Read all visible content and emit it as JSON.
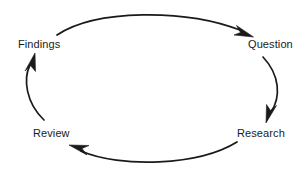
{
  "diagram": {
    "type": "cycle",
    "title": "",
    "stroke_color": "#1a1a1a",
    "background_color": "#ffffff",
    "text_color": "#1a1a1a",
    "nodes": [
      {
        "id": "findings",
        "label": "Findings",
        "position": "top-left"
      },
      {
        "id": "question",
        "label": "Question",
        "position": "top-right"
      },
      {
        "id": "research",
        "label": "Research",
        "position": "bottom-right"
      },
      {
        "id": "review",
        "label": "Review",
        "position": "bottom-left"
      }
    ],
    "edges": [
      {
        "id": "findings-to-question",
        "from": "Findings",
        "to": "Question",
        "direction": "clockwise",
        "arrowhead": "end"
      },
      {
        "id": "question-to-research",
        "from": "Question",
        "to": "Research",
        "direction": "clockwise",
        "arrowhead": "end"
      },
      {
        "id": "research-to-review",
        "from": "Research",
        "to": "Review",
        "direction": "clockwise",
        "arrowhead": "end"
      },
      {
        "id": "review-to-findings",
        "from": "Review",
        "to": "Findings",
        "direction": "clockwise",
        "arrowhead": "end"
      }
    ]
  }
}
